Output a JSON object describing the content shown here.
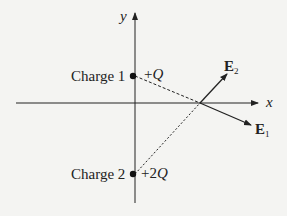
{
  "diagram": {
    "type": "electric-field-vectors",
    "axes": {
      "x_label": "x",
      "y_label": "y"
    },
    "charges": [
      {
        "name": "Charge 1",
        "value_sign": "+",
        "value_coef": "",
        "value_symbol": "Q",
        "position": "on positive y-axis"
      },
      {
        "name": "Charge 2",
        "value_sign": "+",
        "value_coef": "2",
        "value_symbol": "Q",
        "position": "on negative y-axis"
      }
    ],
    "vectors": [
      {
        "label": "E",
        "subscript": "2",
        "direction": "up-right, away from Charge 2"
      },
      {
        "label": "E",
        "subscript": "1",
        "direction": "down-right, away from Charge 1"
      }
    ],
    "field_point": "on positive x-axis",
    "colors": {
      "ink": "#222222",
      "background": "#f4f4f2"
    }
  }
}
